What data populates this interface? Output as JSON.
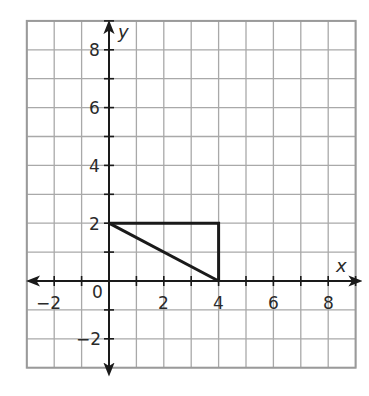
{
  "chart_data": {
    "type": "line",
    "title": "",
    "xlabel": "x",
    "ylabel": "y",
    "xlim": [
      -3,
      9
    ],
    "ylim": [
      -3,
      9
    ],
    "grid": true,
    "grid_step": 1,
    "x_ticks": [
      -2,
      2,
      4,
      6,
      8
    ],
    "y_ticks": [
      -2,
      2,
      4,
      6,
      8
    ],
    "origin_label": "0",
    "shapes": [
      {
        "name": "rectangle-top-and-right-sides",
        "points": [
          [
            0,
            2
          ],
          [
            4,
            2
          ],
          [
            4,
            0
          ]
        ]
      },
      {
        "name": "diagonal-segment",
        "points": [
          [
            0,
            2
          ],
          [
            4,
            0
          ]
        ]
      }
    ],
    "legend": null
  },
  "labels": {
    "x_axis": "x",
    "y_axis": "y",
    "origin": "0",
    "x_tick_labels": [
      "−2",
      "2",
      "4",
      "6",
      "8"
    ],
    "y_tick_labels": [
      "8",
      "6",
      "4",
      "2",
      "−2"
    ]
  },
  "colors": {
    "grid": "#a9a9a9",
    "border": "#9a9a9a",
    "axis": "#1a1a1a",
    "shape": "#1a1a1a"
  }
}
